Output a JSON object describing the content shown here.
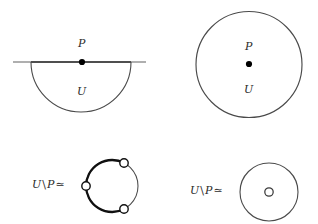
{
  "figure": {
    "caption_symbols": {
      "point_label": "P",
      "set_label": "U",
      "complement_prefix_U": "U",
      "complement_backslash": "\\",
      "complement_point": "P",
      "homotopy_equiv": "≃"
    },
    "panels": [
      {
        "id": "half-disk",
        "name": "half-disk-with-boundary-point",
        "position": "top-left",
        "shape": "half-disk",
        "point_label": "P",
        "point_location": "boundary",
        "region_label": "U",
        "line": {
          "x1": 13,
          "x2": 146,
          "y": 62
        },
        "arc": {
          "cx": 81,
          "cy": 62,
          "r": 50
        },
        "point_dot": {
          "cx": 82,
          "cy": 62,
          "r": 3.1
        },
        "label_P": {
          "x": 78,
          "y": 38
        },
        "label_U": {
          "x": 77,
          "y": 86
        }
      },
      {
        "id": "disk",
        "name": "disk-with-interior-point",
        "position": "top-right",
        "shape": "disk",
        "point_label": "P",
        "point_location": "interior",
        "region_label": "U",
        "circle": {
          "cx": 249,
          "cy": 64.5,
          "r": 53
        },
        "point_dot": {
          "cx": 249,
          "cy": 64,
          "r": 3.1
        },
        "label_P": {
          "x": 245,
          "y": 41
        },
        "label_U": {
          "x": 244,
          "y": 84
        }
      },
      {
        "id": "half-disk-punctured",
        "name": "half-disk-minus-point-homotopy",
        "position": "bottom-left",
        "shape": "circle-with-three-open-points",
        "label_text": "U \\ P ≃",
        "label_pos": {
          "x": 32,
          "y": 178
        },
        "circle": {
          "cx": 112,
          "cy": 186,
          "r": 26
        },
        "open_points": [
          {
            "cx": 124,
            "cy": 163,
            "r": 4.2,
            "name": "open-point-top-right"
          },
          {
            "cx": 86,
            "cy": 186,
            "r": 4.2,
            "name": "open-point-left"
          },
          {
            "cx": 124,
            "cy": 209,
            "r": 4.2,
            "name": "open-point-bottom-right"
          }
        ]
      },
      {
        "id": "disk-punctured",
        "name": "disk-minus-point-homotopy",
        "position": "bottom-right",
        "shape": "punctured-disk",
        "label_text": "U \\ P ≃",
        "label_pos": {
          "x": 190,
          "y": 178
        },
        "circle": {
          "cx": 269,
          "cy": 192,
          "r": 29
        },
        "puncture": {
          "cx": 269,
          "cy": 192,
          "r": 4.2
        }
      }
    ],
    "colors": {
      "ink": "#2b2b2b",
      "thin_stroke": "#4a4a4a",
      "bold_stroke": "#1a1a1a",
      "background": "#ffffff"
    }
  }
}
